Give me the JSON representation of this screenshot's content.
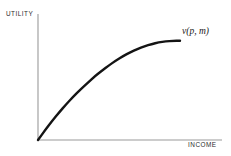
{
  "figure": {
    "type": "economics-diagram",
    "title_visible": false,
    "background_color": "#ffffff"
  },
  "axes": {
    "y_label": "UTILITY",
    "x_label": "INCOME",
    "axis_color": "#9a9a9a",
    "label_color": "#2b2b2b"
  },
  "curve": {
    "label": "v(p, m)",
    "color": "#141414",
    "shape": "concave-increasing"
  },
  "chart_data": {
    "type": "line",
    "title": "",
    "xlabel": "INCOME",
    "ylabel": "UTILITY",
    "xlim": [
      0,
      100
    ],
    "ylim": [
      0,
      100
    ],
    "grid": false,
    "legend": "none",
    "annotations": [
      {
        "text": "v(p, m)",
        "x": 100,
        "y": 88,
        "style": "italic",
        "placement": "right-of-curve-end"
      }
    ],
    "series": [
      {
        "name": "v(p, m)",
        "color": "#141414",
        "x": [
          0,
          5,
          10,
          15,
          20,
          25,
          30,
          35,
          40,
          45,
          50,
          55,
          60,
          65,
          70,
          75,
          80,
          85,
          90,
          95,
          100
        ],
        "y": [
          0,
          9,
          17.5,
          25.5,
          33,
          40,
          46.5,
          52.5,
          58.5,
          63.5,
          68.5,
          73,
          77,
          80.5,
          83.5,
          86,
          88,
          89.5,
          90.5,
          91,
          91
        ]
      }
    ]
  }
}
